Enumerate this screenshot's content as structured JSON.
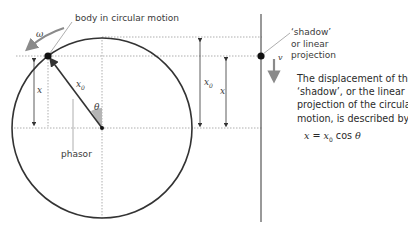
{
  "diagram": {
    "type": "phasor projection diagram",
    "colors": {
      "circle": "#333333",
      "dotted": "#9a9a9a",
      "arrow_grey": "#8a8a8a",
      "angle_fill": "#b5b5b5",
      "text": "#3a3a3a"
    },
    "labels": {
      "body": "body in circular motion",
      "omega": "ω",
      "x0_phasor": "x",
      "x0_sub": "0",
      "theta": "θ",
      "phasor": "phasor",
      "x_left": "x",
      "x0_right": "x",
      "x0_right_sub": "0",
      "x_right": "x",
      "v": "v",
      "shadow_line1": "‘shadow’",
      "shadow_line2": "or linear",
      "shadow_line3": "projection"
    },
    "description": {
      "line1": "The displacement of the",
      "line2": "‘shadow’, or the linear",
      "line3": "projection of the circular",
      "line4": "motion, is described by"
    },
    "equation": {
      "lhs": "x",
      "eq": " = ",
      "x0": "x",
      "x0_sub": "0",
      "fn": " cos ",
      "theta": "θ"
    }
  }
}
